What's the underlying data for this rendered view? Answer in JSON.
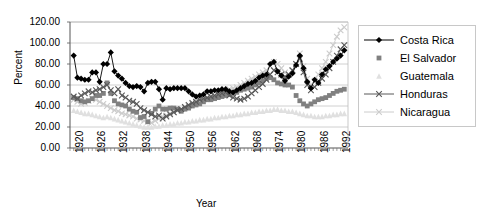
{
  "chart_data": {
    "type": "line",
    "title": "",
    "xlabel": "Year",
    "ylabel": "Percent",
    "xlim": [
      1920,
      1995
    ],
    "ylim": [
      0,
      120
    ],
    "ytick_labels": [
      "0.00",
      "20.00",
      "40.00",
      "60.00",
      "80.00",
      "100.00",
      "120.00"
    ],
    "ytick_values": [
      0,
      20,
      40,
      60,
      80,
      100,
      120
    ],
    "xtick_labels": [
      "1920",
      "1926",
      "1932",
      "1938",
      "1944",
      "1950",
      "1956",
      "1962",
      "1968",
      "1974",
      "1980",
      "1986",
      "1992"
    ],
    "xtick_values": [
      1920,
      1926,
      1932,
      1938,
      1944,
      1950,
      1956,
      1962,
      1968,
      1974,
      1980,
      1986,
      1992
    ],
    "grid": "horizontal",
    "legend_position": "right",
    "x": [
      1920,
      1921,
      1922,
      1923,
      1924,
      1925,
      1926,
      1927,
      1928,
      1929,
      1930,
      1931,
      1932,
      1933,
      1934,
      1935,
      1936,
      1937,
      1938,
      1939,
      1940,
      1941,
      1942,
      1943,
      1944,
      1945,
      1946,
      1947,
      1948,
      1949,
      1950,
      1951,
      1952,
      1953,
      1954,
      1955,
      1956,
      1957,
      1958,
      1959,
      1960,
      1961,
      1962,
      1963,
      1964,
      1965,
      1966,
      1967,
      1968,
      1969,
      1970,
      1971,
      1972,
      1973,
      1974,
      1975,
      1976,
      1977,
      1978,
      1979,
      1980,
      1981,
      1982,
      1983,
      1984,
      1985,
      1986,
      1987,
      1988,
      1989,
      1990,
      1991,
      1992,
      1993,
      1994
    ],
    "series": [
      {
        "name": "Costa Rica",
        "color": "#000000",
        "marker": "diamond",
        "line": true,
        "values": [
          null,
          88,
          67,
          66,
          65,
          65,
          72,
          72,
          63,
          80,
          80,
          91,
          73,
          69,
          66,
          62,
          59,
          58,
          59,
          58,
          54,
          62,
          63,
          63,
          56,
          46,
          57,
          56,
          57,
          57,
          57,
          57,
          54,
          51,
          49,
          50,
          51,
          54,
          54,
          55,
          55,
          56,
          56,
          54,
          53,
          55,
          57,
          59,
          61,
          62,
          64,
          67,
          69,
          70,
          80,
          82,
          73,
          69,
          64,
          68,
          71,
          79,
          88,
          76,
          63,
          57,
          65,
          62,
          70,
          75,
          78,
          82,
          85,
          88,
          93
        ]
      },
      {
        "name": "El Salvador",
        "color": "#808080",
        "marker": "square",
        "line": false,
        "values": [
          null,
          48,
          47,
          45,
          44,
          45,
          47,
          50,
          50,
          52,
          62,
          52,
          45,
          42,
          41,
          40,
          37,
          35,
          34,
          29,
          30,
          25,
          33,
          37,
          40,
          37,
          37,
          38,
          38,
          37,
          35,
          37,
          38,
          40,
          41,
          42,
          44,
          46,
          46,
          47,
          48,
          49,
          50,
          51,
          52,
          53,
          55,
          56,
          57,
          58,
          60,
          62,
          64,
          66,
          67,
          65,
          62,
          61,
          60,
          60,
          58,
          50,
          45,
          42,
          40,
          42,
          44,
          46,
          47,
          48,
          50,
          52,
          54,
          55,
          56
        ]
      },
      {
        "name": "Guatemala",
        "color": "#e0e0e0",
        "marker": "triangle",
        "line": false,
        "values": [
          null,
          36,
          35,
          34,
          33,
          33,
          32,
          31,
          30,
          29,
          30,
          29,
          28,
          27,
          26,
          25,
          24,
          23,
          22,
          21,
          20,
          20,
          20,
          21,
          21,
          22,
          22,
          23,
          23,
          24,
          24,
          25,
          25,
          26,
          26,
          27,
          27,
          28,
          28,
          29,
          29,
          30,
          30,
          31,
          31,
          32,
          32,
          33,
          33,
          34,
          34,
          35,
          35,
          36,
          36,
          37,
          37,
          36,
          36,
          35,
          35,
          34,
          33,
          32,
          31,
          31,
          30,
          30,
          30,
          31,
          31,
          32,
          32,
          33,
          33
        ]
      },
      {
        "name": "Honduras",
        "color": "#595959",
        "marker": "x",
        "line": true,
        "values": [
          null,
          49,
          47,
          50,
          52,
          54,
          53,
          55,
          56,
          58,
          60,
          55,
          52,
          56,
          50,
          48,
          45,
          44,
          42,
          38,
          36,
          34,
          32,
          30,
          31,
          28,
          30,
          32,
          34,
          36,
          37,
          39,
          41,
          43,
          44,
          46,
          47,
          48,
          49,
          50,
          51,
          52,
          53,
          50,
          48,
          47,
          46,
          47,
          49,
          52,
          55,
          58,
          61,
          65,
          70,
          74,
          72,
          70,
          68,
          70,
          74,
          80,
          85,
          72,
          60,
          55,
          58,
          62,
          66,
          70,
          76,
          82,
          88,
          94,
          98
        ]
      },
      {
        "name": "Nicaragua",
        "color": "#cccccc",
        "marker": "x",
        "line": true,
        "values": [
          null,
          46,
          44,
          42,
          43,
          45,
          47,
          46,
          44,
          42,
          40,
          38,
          36,
          35,
          33,
          32,
          31,
          30,
          28,
          27,
          26,
          25,
          24,
          26,
          28,
          30,
          31,
          33,
          34,
          36,
          37,
          39,
          40,
          42,
          43,
          45,
          46,
          48,
          49,
          50,
          52,
          53,
          54,
          56,
          57,
          58,
          60,
          62,
          64,
          66,
          68,
          70,
          72,
          74,
          78,
          82,
          80,
          76,
          72,
          70,
          74,
          80,
          90,
          78,
          66,
          60,
          64,
          70,
          76,
          82,
          90,
          98,
          106,
          112,
          115
        ]
      }
    ]
  },
  "legend": {
    "items": [
      {
        "label": "Costa Rica"
      },
      {
        "label": "El Salvador"
      },
      {
        "label": "Guatemala"
      },
      {
        "label": "Honduras"
      },
      {
        "label": "Nicaragua"
      }
    ]
  }
}
